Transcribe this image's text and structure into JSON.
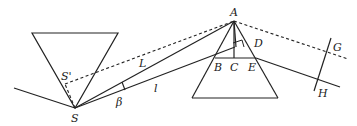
{
  "diagram": {
    "type": "geometry",
    "labels": {
      "A": "A",
      "B": "B",
      "C": "C",
      "D": "D",
      "E": "E",
      "G": "G",
      "H": "H",
      "S": "S",
      "S_prime": "S'",
      "L": "L",
      "l": "l",
      "beta": "β"
    },
    "colors": {
      "stroke": "#222222",
      "background": "#ffffff"
    }
  }
}
